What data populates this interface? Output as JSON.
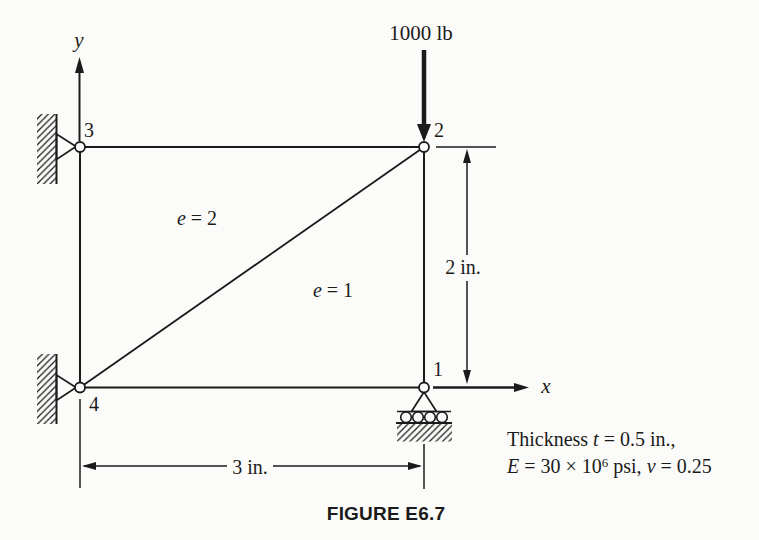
{
  "figure": {
    "caption": "FIGURE E6.7",
    "load_label": "1000 lb",
    "axes": {
      "x": "x",
      "y": "y"
    },
    "nodes": {
      "n1": "1",
      "n2": "2",
      "n3": "3",
      "n4": "4"
    },
    "elements": {
      "e1": {
        "sym": "e",
        "rest": " = 1"
      },
      "e2": {
        "sym": "e",
        "rest": " = 2"
      }
    },
    "dimensions": {
      "height": "2 in.",
      "width": "3 in."
    },
    "notes": {
      "line1": {
        "p1": "Thickness ",
        "var": "t",
        "p2": " = 0.5 in.,"
      },
      "line2": {
        "var1": "E",
        "p1": " = 30 × 10",
        "sup": "6",
        "p2": " psi, ",
        "var2": "ν",
        "p3": " = 0.25"
      }
    },
    "colors": {
      "ink": "#1b1b1b",
      "paper": "#fbfbf9"
    }
  }
}
